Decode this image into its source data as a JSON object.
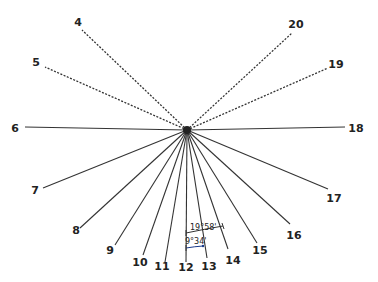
{
  "diagram": {
    "type": "radial-line-diagram",
    "center": {
      "x": 187,
      "y": 130
    },
    "colors": {
      "line": "#333333",
      "center_dot": "#222222",
      "arc_a": "#333333",
      "arc_b": "#1a3a8a",
      "arc_b_fill": "#e8e8a0"
    },
    "rays": [
      {
        "id": "4",
        "label": "4",
        "style": "dashed",
        "end": [
          82,
          30
        ],
        "label_pos": [
          78,
          26
        ]
      },
      {
        "id": "5",
        "label": "5",
        "style": "dashed",
        "end": [
          45,
          67
        ],
        "label_pos": [
          36,
          66
        ]
      },
      {
        "id": "6",
        "label": "6",
        "style": "solid",
        "end": [
          25,
          127
        ],
        "label_pos": [
          15,
          132
        ]
      },
      {
        "id": "7",
        "label": "7",
        "style": "solid",
        "end": [
          43,
          188
        ],
        "label_pos": [
          35,
          194
        ]
      },
      {
        "id": "8",
        "label": "8",
        "style": "solid",
        "end": [
          80,
          228
        ],
        "label_pos": [
          76,
          234
        ]
      },
      {
        "id": "9",
        "label": "9",
        "style": "solid",
        "end": [
          115,
          245
        ],
        "label_pos": [
          110,
          254
        ]
      },
      {
        "id": "10",
        "label": "10",
        "style": "solid",
        "end": [
          143,
          255
        ],
        "label_pos": [
          140,
          266
        ]
      },
      {
        "id": "11",
        "label": "11",
        "style": "solid",
        "end": [
          165,
          262
        ],
        "label_pos": [
          162,
          270
        ]
      },
      {
        "id": "12",
        "label": "12",
        "style": "solid",
        "end": [
          186,
          262
        ],
        "label_pos": [
          186,
          271
        ]
      },
      {
        "id": "13",
        "label": "13",
        "style": "solid",
        "end": [
          207,
          258
        ],
        "label_pos": [
          209,
          270
        ]
      },
      {
        "id": "14",
        "label": "14",
        "style": "solid",
        "end": [
          228,
          249
        ],
        "label_pos": [
          233,
          264
        ]
      },
      {
        "id": "15",
        "label": "15",
        "style": "solid",
        "end": [
          257,
          243
        ],
        "label_pos": [
          260,
          254
        ]
      },
      {
        "id": "16",
        "label": "16",
        "style": "solid",
        "end": [
          290,
          224
        ],
        "label_pos": [
          294,
          239
        ]
      },
      {
        "id": "17",
        "label": "17",
        "style": "solid",
        "end": [
          328,
          189
        ],
        "label_pos": [
          334,
          202
        ]
      },
      {
        "id": "18",
        "label": "18",
        "style": "solid",
        "end": [
          345,
          127
        ],
        "label_pos": [
          356,
          132
        ]
      },
      {
        "id": "19",
        "label": "19",
        "style": "dashed",
        "end": [
          328,
          68
        ],
        "label_pos": [
          336,
          68
        ]
      },
      {
        "id": "20",
        "label": "20",
        "style": "dashed",
        "end": [
          292,
          33
        ],
        "label_pos": [
          296,
          28
        ]
      }
    ],
    "angles": [
      {
        "id": "angle-12-14",
        "label": "19°58'",
        "between": [
          "12",
          "14"
        ]
      },
      {
        "id": "angle-12-13",
        "label": "9°34'",
        "between": [
          "12",
          "13"
        ]
      }
    ]
  }
}
